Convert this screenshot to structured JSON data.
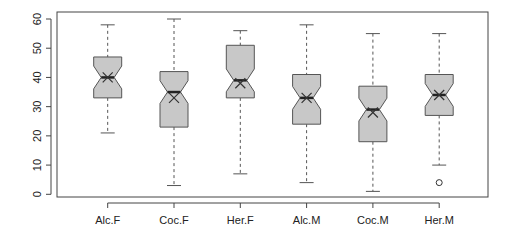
{
  "chart_data": {
    "type": "boxplot",
    "title": "",
    "xlabel": "",
    "ylabel": "",
    "ylim": [
      0,
      60
    ],
    "yticks": [
      0,
      10,
      20,
      30,
      40,
      50,
      60
    ],
    "grid": false,
    "notched": true,
    "mean_marker": "x",
    "categories": [
      "Alc.F",
      "Coc.F",
      "Her.F",
      "Alc.M",
      "Coc.M",
      "Her.M"
    ],
    "series": [
      {
        "name": "Alc.F",
        "whisker_low": 21,
        "q1": 33,
        "median": 40,
        "q3": 47,
        "whisker_high": 58,
        "mean": 40,
        "outliers": []
      },
      {
        "name": "Coc.F",
        "whisker_low": 3,
        "q1": 23,
        "median": 35,
        "q3": 42,
        "whisker_high": 60,
        "mean": 33,
        "outliers": []
      },
      {
        "name": "Her.F",
        "whisker_low": 7,
        "q1": 33,
        "median": 39,
        "q3": 51,
        "whisker_high": 56,
        "mean": 38,
        "outliers": []
      },
      {
        "name": "Alc.M",
        "whisker_low": 4,
        "q1": 24,
        "median": 33,
        "q3": 41,
        "whisker_high": 58,
        "mean": 33,
        "outliers": []
      },
      {
        "name": "Coc.M",
        "whisker_low": 1,
        "q1": 18,
        "median": 29,
        "q3": 37,
        "whisker_high": 55,
        "mean": 28,
        "outliers": []
      },
      {
        "name": "Her.M",
        "whisker_low": 10,
        "q1": 27,
        "median": 34,
        "q3": 41,
        "whisker_high": 55,
        "mean": 34,
        "outliers": [
          4
        ]
      }
    ],
    "colors": {
      "box_fill": "#c8c8c8",
      "box_stroke": "#555555",
      "median": "#222222",
      "axis": "#444444"
    }
  }
}
